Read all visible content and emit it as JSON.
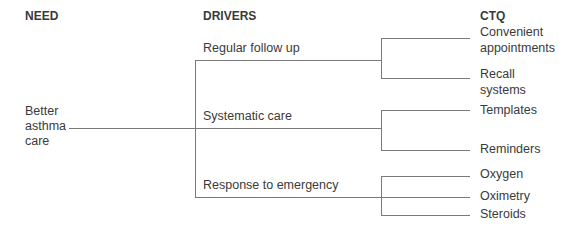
{
  "headers": {
    "need": "NEED",
    "drivers": "DRIVERS",
    "ctq": "CTQ"
  },
  "need": {
    "line1": "Better",
    "line2": "asthma",
    "line3": "care"
  },
  "drivers": [
    {
      "label": "Regular follow up",
      "ctq": [
        {
          "l1": "Convenient",
          "l2": "appointments"
        },
        {
          "l1": "Recall",
          "l2": "systems"
        }
      ]
    },
    {
      "label": "Systematic care",
      "ctq": [
        {
          "l1": "Templates"
        },
        {
          "l1": "Reminders"
        }
      ]
    },
    {
      "label": "Response to emergency",
      "ctq": [
        {
          "l1": "Oxygen"
        },
        {
          "l1": "Oximetry"
        },
        {
          "l1": "Steroids"
        }
      ]
    }
  ]
}
